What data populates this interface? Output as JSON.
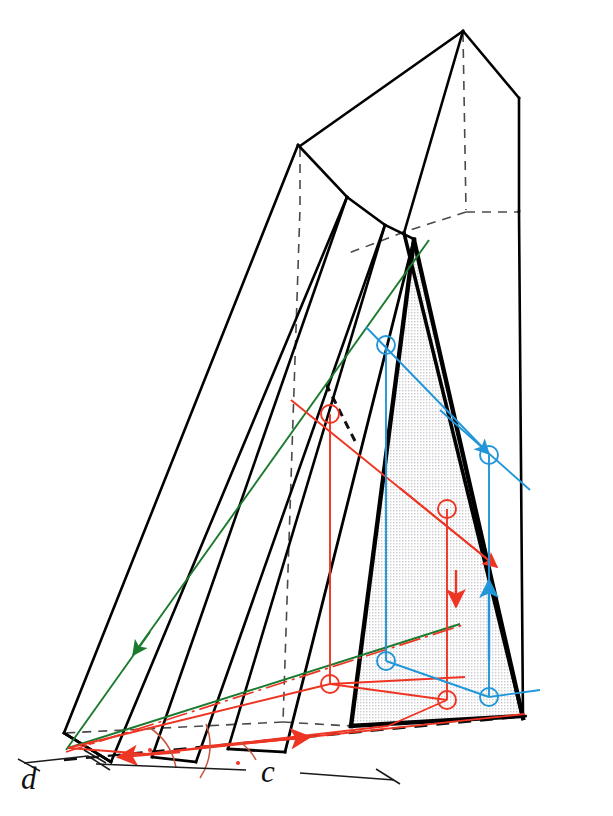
{
  "figure": {
    "type": "descriptive-geometry-projection",
    "title": "",
    "background": "#ffffff"
  },
  "labels": {
    "dimension_d": "d",
    "dimension_c": "c"
  },
  "colors": {
    "outline": "#000000",
    "hidden_line": "#4a4a4a",
    "red": "#ee3524",
    "blue": "#2196d9",
    "green": "#1a7a2e",
    "angle_arc": "#c8553b",
    "shade_fill": "#e8e8ea",
    "dimension_line": "#1a1a1a"
  },
  "elements": {
    "solid_name": "triangular-prism",
    "shaded_face_name": "cutting-plane-triangle",
    "red_line_name": "line-a-trace",
    "blue_line_name": "line-b-trace",
    "green_line_name": "line-c-trace",
    "ground_line_name": "ground-line",
    "angle_marks": 2,
    "intersection_markers_red": 4,
    "intersection_markers_blue": 4,
    "arrow_count_red": 3,
    "arrow_count_blue": 2,
    "arrow_count_green": 1
  },
  "geometry": {
    "prism_outline": "M 463,31 L 520,98 L 520,720 L 64,762 L 64,733 L 300,143 Z",
    "base_points": [
      [
        64,
        762
      ],
      [
        520,
        720
      ],
      [
        463,
        31
      ]
    ]
  }
}
